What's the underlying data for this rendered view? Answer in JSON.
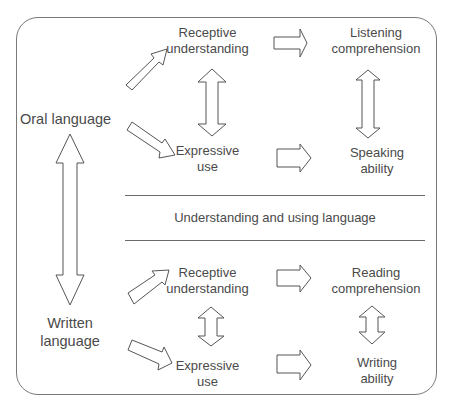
{
  "diagram": {
    "left": {
      "oral": "Oral language",
      "written_line1": "Written",
      "written_line2": "language"
    },
    "oral_section": {
      "receptive_line1": "Receptive",
      "receptive_line2": "understanding",
      "expressive_line1": "Expressive",
      "expressive_line2": "use",
      "outcome_receptive_line1": "Listening",
      "outcome_receptive_line2": "comprehension",
      "outcome_expressive_line1": "Speaking",
      "outcome_expressive_line2": "ability"
    },
    "middle": {
      "caption": "Understanding and using language"
    },
    "written_section": {
      "receptive_line1": "Receptive",
      "receptive_line2": "understanding",
      "expressive_line1": "Expressive",
      "expressive_line2": "use",
      "outcome_receptive_line1": "Reading",
      "outcome_receptive_line2": "comprehension",
      "outcome_expressive_line1": "Writing",
      "outcome_expressive_line2": "ability"
    },
    "colors": {
      "stroke": "#555555",
      "text": "#4a4a4a",
      "background": "#ffffff"
    }
  }
}
